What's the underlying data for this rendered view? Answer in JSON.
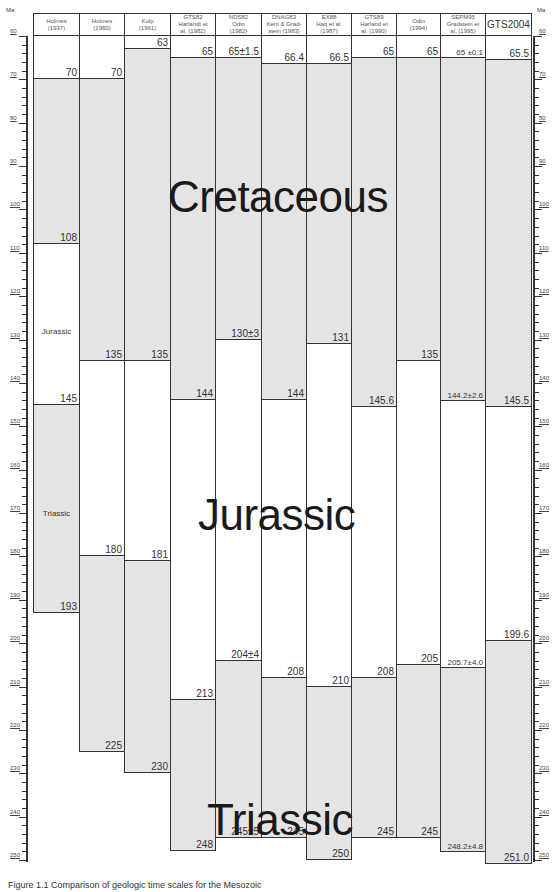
{
  "chart_data": {
    "type": "bar",
    "ylabel": "Ma",
    "ylim": [
      60,
      250
    ],
    "y_ticks": [
      60,
      70,
      80,
      90,
      100,
      110,
      120,
      130,
      140,
      150,
      160,
      170,
      180,
      190,
      200,
      210,
      220,
      230,
      240,
      250
    ],
    "periods": [
      "Cretaceous",
      "Jurassic",
      "Triassic"
    ],
    "columns": [
      {
        "name": "Holmes (1937)",
        "top": 70,
        "boundaries": [
          {
            "age": 70,
            "label": "70"
          },
          {
            "age": 108,
            "label": "108"
          },
          {
            "age": 145,
            "label": "145"
          },
          {
            "age": 193,
            "label": "193"
          }
        ],
        "period_labels": [
          {
            "text": "Jurassic",
            "age": 127
          },
          {
            "text": "Triassic",
            "age": 169
          }
        ]
      },
      {
        "name": "Holmes (1960)",
        "boundaries": [
          {
            "age": 70,
            "label": "70"
          },
          {
            "age": 135,
            "label": "135"
          },
          {
            "age": 180,
            "label": "180"
          },
          {
            "age": 225,
            "label": "225"
          }
        ]
      },
      {
        "name": "Kulp (1961)",
        "boundaries": [
          {
            "age": 63,
            "label": "63"
          },
          {
            "age": 135,
            "label": "135"
          },
          {
            "age": 181,
            "label": "181"
          },
          {
            "age": 230,
            "label": "230"
          }
        ]
      },
      {
        "name": "GTS82 Harlandt et al. (1982)",
        "boundaries": [
          {
            "age": 65,
            "label": "65"
          },
          {
            "age": 144,
            "label": "144"
          },
          {
            "age": 213,
            "label": "213"
          },
          {
            "age": 248,
            "label": "248"
          }
        ]
      },
      {
        "name": "NDS82 Odin (1982)",
        "boundaries": [
          {
            "age": 65,
            "label": "65±1.5"
          },
          {
            "age": 130,
            "label": "130±3"
          },
          {
            "age": 204,
            "label": "204±4"
          },
          {
            "age": 245,
            "label": "245±5"
          }
        ]
      },
      {
        "name": "DNAG83 Kent & Gradstein (1983)",
        "boundaries": [
          {
            "age": 66.4,
            "label": "66.4"
          },
          {
            "age": 144,
            "label": "144"
          },
          {
            "age": 208,
            "label": "208"
          },
          {
            "age": 245,
            "label": "245"
          }
        ]
      },
      {
        "name": "EX88 Haq et al. (1987)",
        "boundaries": [
          {
            "age": 66.5,
            "label": "66.5"
          },
          {
            "age": 131,
            "label": "131"
          },
          {
            "age": 210,
            "label": "210"
          },
          {
            "age": 250,
            "label": "250"
          }
        ]
      },
      {
        "name": "GTS89 Harland et al. (1990)",
        "boundaries": [
          {
            "age": 65,
            "label": "65"
          },
          {
            "age": 145.6,
            "label": "145.6"
          },
          {
            "age": 208,
            "label": "208"
          },
          {
            "age": 245,
            "label": "245"
          }
        ]
      },
      {
        "name": "Odin (1994)",
        "boundaries": [
          {
            "age": 65,
            "label": "65"
          },
          {
            "age": 135,
            "label": "135"
          },
          {
            "age": 205,
            "label": "205"
          },
          {
            "age": 245,
            "label": "245"
          }
        ]
      },
      {
        "name": "SEPM95 Gradstein et al. (1995)",
        "boundaries": [
          {
            "age": 65,
            "label": "65 ±0.1"
          },
          {
            "age": 144.2,
            "label": "144.2±2.6"
          },
          {
            "age": 205.7,
            "label": "205.7±4.0"
          },
          {
            "age": 248.2,
            "label": "248.2±4.8"
          }
        ]
      },
      {
        "name": "GTS2004",
        "boundaries": [
          {
            "age": 65.5,
            "label": "65.5"
          },
          {
            "age": 145.5,
            "label": "145.5"
          },
          {
            "age": 199.6,
            "label": "199.6"
          },
          {
            "age": 251.0,
            "label": "251.0"
          }
        ]
      }
    ],
    "grid": false,
    "legend": "none"
  },
  "axis": {
    "unit": "Ma",
    "ticks": [
      "60",
      "70",
      "80",
      "90",
      "100",
      "110",
      "120",
      "130",
      "140",
      "150",
      "160",
      "170",
      "180",
      "190",
      "200",
      "210",
      "220",
      "230",
      "240",
      "250"
    ]
  },
  "headers": [
    {
      "l1": "Holmes",
      "l2": "(1937)"
    },
    {
      "l1": "Holmes",
      "l2": "(1960)"
    },
    {
      "l1": "Kulp",
      "l2": "(1961)"
    },
    {
      "l1": "GTS82",
      "l2": "Harlandt et",
      "l3": "al. (1982)"
    },
    {
      "l1": "NDS82",
      "l2": "Odin",
      "l3": "(1982)"
    },
    {
      "l1": "DNAG83",
      "l2": "Kent & Grad-",
      "l3": "stein (1983)"
    },
    {
      "l1": "EX88",
      "l2": "Haq et al.",
      "l3": "(1987)"
    },
    {
      "l1": "GTS89",
      "l2": "Harland et",
      "l3": "al. (1990)"
    },
    {
      "l1": "Odin",
      "l2": "(1994)"
    },
    {
      "l1": "SEPM95",
      "l2": "Gradstein et",
      "l3": "al. (1995)"
    },
    {
      "l1": "GTS2004"
    }
  ],
  "period_titles": {
    "cretaceous": "Cretaceous",
    "jurassic": "Jurassic",
    "triassic": "Triassic"
  },
  "caption": "Figure 1.1  Comparison of geologic time scales for the Mesozoic"
}
